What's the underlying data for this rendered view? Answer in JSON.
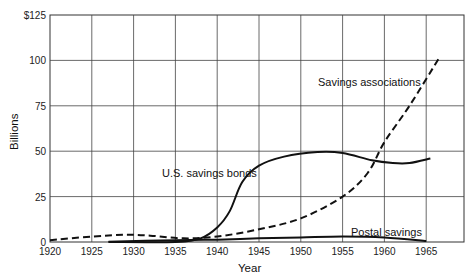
{
  "chart_data": {
    "type": "line",
    "title": "",
    "xlabel": "Year",
    "ylabel": "Billions",
    "xlim": [
      1920,
      1968.5
    ],
    "ylim": [
      0,
      125
    ],
    "grid": true,
    "legend": "inline labels",
    "x_ticks": [
      "1920",
      "1925",
      "1930",
      "1935",
      "1940",
      "1945",
      "1950",
      "1955",
      "1960",
      "1965"
    ],
    "y_ticks": [
      "0",
      "25",
      "50",
      "75",
      "100",
      "$125"
    ],
    "series": [
      {
        "name": "Savings associations",
        "style": "dashed",
        "x": [
          1920,
          1925,
          1929,
          1932,
          1936,
          1940,
          1945,
          1950,
          1955,
          1958,
          1960,
          1963,
          1966.5
        ],
        "values": [
          1,
          3,
          4,
          3.5,
          2,
          3,
          7,
          13,
          25,
          38,
          55,
          75,
          101
        ]
      },
      {
        "name": "U.S. savings bonds",
        "style": "solid",
        "x": [
          1927,
          1935,
          1938,
          1940,
          1941.5,
          1943,
          1945,
          1948,
          1952,
          1955,
          1958.5,
          1961,
          1963,
          1965.5
        ],
        "values": [
          0,
          0,
          2,
          8,
          17,
          33,
          42,
          47,
          49.5,
          49,
          45,
          43.5,
          43.5,
          46
        ]
      },
      {
        "name": "Postal savings",
        "style": "solid",
        "x": [
          1927,
          1935,
          1940,
          1945,
          1950,
          1955,
          1960,
          1965
        ],
        "values": [
          0.2,
          1,
          1.3,
          2,
          2.5,
          3,
          2.5,
          0.5
        ]
      }
    ],
    "annotations": [
      {
        "text": "Savings associations",
        "near": [
          1957,
          87
        ]
      },
      {
        "text": "U.S. savings bonds",
        "near": [
          1936,
          37
        ]
      },
      {
        "text": "Postal savings",
        "near": [
          1959.5,
          6
        ]
      }
    ]
  },
  "labels": {
    "savings_assoc": "Savings associations",
    "bonds": "U.S. savings bonds",
    "postal": "Postal savings",
    "xlabel": "Year",
    "ylabel": "Billions"
  },
  "ticks": {
    "x": [
      "1920",
      "1925",
      "1930",
      "1935",
      "1940",
      "1945",
      "1950",
      "1955",
      "1960",
      "1965"
    ],
    "y": [
      "0",
      "25",
      "50",
      "75",
      "100",
      "$125"
    ]
  }
}
